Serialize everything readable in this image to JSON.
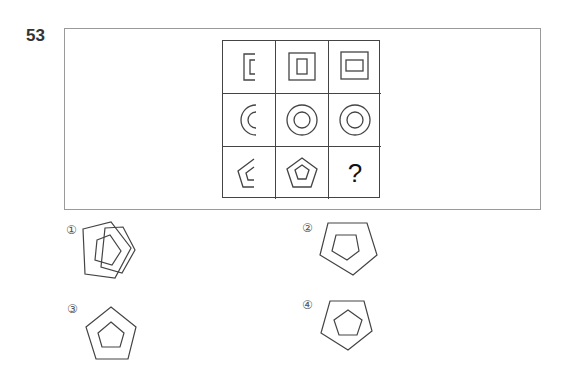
{
  "question": {
    "number": "53"
  },
  "grid": {
    "rows": [
      {
        "shape": "rectangle",
        "cells": [
          "partial-nested-rectangle",
          "nested-rectangle-vertical-inner",
          "nested-rectangle-horizontal-inner"
        ]
      },
      {
        "shape": "circle",
        "cells": [
          "partial-concentric-arc",
          "concentric-circles",
          "concentric-circles"
        ]
      },
      {
        "shape": "pentagon",
        "cells": [
          "partial-nested-pentagon",
          "nested-pentagon",
          "unknown"
        ]
      }
    ],
    "missing_cell_symbol": "?"
  },
  "options": [
    {
      "label": "①",
      "description": "outer pentagon rotated right, inner pentagon rotated right"
    },
    {
      "label": "②",
      "description": "outer pentagon pointing down, inner pentagon pointing down"
    },
    {
      "label": "③",
      "description": "outer pentagon pointing up, inner pentagon pointing up"
    },
    {
      "label": "④",
      "description": "outer pentagon pointing down, inner pentagon pointing up"
    }
  ],
  "colors": {
    "stroke": "#444444",
    "frame": "#9a9a9a",
    "text": "#333333"
  }
}
